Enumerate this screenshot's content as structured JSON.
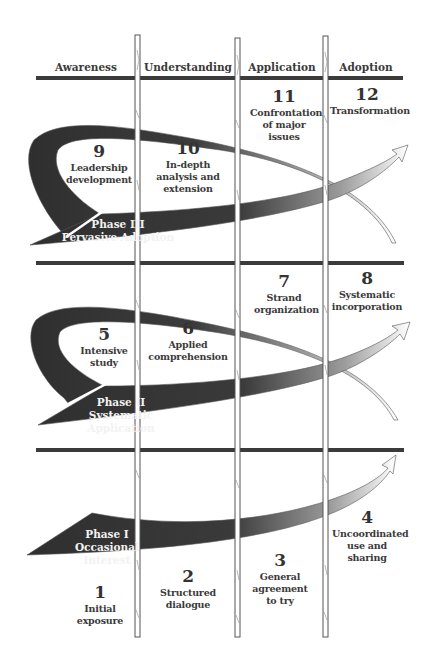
{
  "columns": [
    "Awareness",
    "Understanding",
    "Application",
    "Adoption"
  ],
  "phases": [
    {
      "title": "Phase III",
      "subtitle": "Pervasive Adoption"
    },
    {
      "title": "Phase II",
      "subtitle": "Systematic Application"
    },
    {
      "title": "Phase I",
      "subtitle": "Occasional Interest"
    }
  ],
  "stages": [
    {
      "num": "1",
      "label": "Initial exposure"
    },
    {
      "num": "2",
      "label": "Structured dialogue"
    },
    {
      "num": "3",
      "label": "General agreement to try"
    },
    {
      "num": "4",
      "label": "Uncoordinated use and sharing"
    },
    {
      "num": "5",
      "label": "Intensive study"
    },
    {
      "num": "6",
      "label": "Applied comprehension"
    },
    {
      "num": "7",
      "label": "Strand organization"
    },
    {
      "num": "8",
      "label": "Systematic incorporation"
    },
    {
      "num": "9",
      "label": "Leadership development"
    },
    {
      "num": "10",
      "label": "In-depth analysis and extension"
    },
    {
      "num": "11",
      "label": "Confrontation of major issues"
    },
    {
      "num": "12",
      "label": "Transformation"
    }
  ],
  "colors": {
    "bar": "#3b3b3b",
    "arrow_dark": "#2f2f2f",
    "arrow_light": "#ffffff",
    "post": "#ffffff",
    "post_stroke": "#555555"
  }
}
